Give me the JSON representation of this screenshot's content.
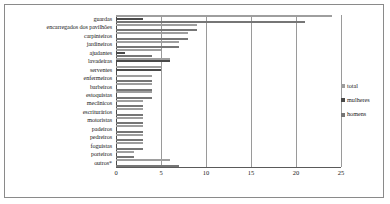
{
  "chart_data": {
    "type": "bar",
    "orientation": "horizontal",
    "title": "",
    "xlabel": "",
    "ylabel": "",
    "xlim": [
      0,
      25
    ],
    "xticks": [
      "0",
      "5",
      "10",
      "15",
      "20",
      "25"
    ],
    "grid": true,
    "legend_position": "right",
    "categories": [
      "guardas",
      "encarregados dos pavilhões",
      "carpinteiros",
      "jardineiros",
      "ajudantes",
      "lavadeiras",
      "serventes",
      "enfermeiros",
      "barbeiros",
      "estoquistas",
      "mecânicos",
      "escriturários",
      "motoristas",
      "padeiros",
      "pedreiros",
      "foguistas",
      "porteiros",
      "outros*"
    ],
    "series": [
      {
        "name": "total",
        "color": "#9e9e9e",
        "values": [
          24,
          9,
          8,
          7,
          5,
          6,
          5,
          4,
          4,
          4,
          3,
          3,
          3,
          3,
          3,
          3,
          2,
          6
        ]
      },
      {
        "name": "mulheres",
        "color": "#4a4a4a",
        "values": [
          3,
          0,
          0,
          0,
          1,
          6,
          5,
          0,
          0,
          0,
          0,
          0,
          0,
          0,
          0,
          0,
          0,
          0
        ]
      },
      {
        "name": "homens",
        "color": "#767676",
        "values": [
          21,
          9,
          8,
          7,
          4,
          0,
          0,
          4,
          4,
          4,
          3,
          3,
          3,
          3,
          3,
          3,
          2,
          7
        ]
      }
    ]
  },
  "legend": {
    "items": [
      {
        "label": "total"
      },
      {
        "label": "mulheres"
      },
      {
        "label": "homens"
      }
    ]
  }
}
